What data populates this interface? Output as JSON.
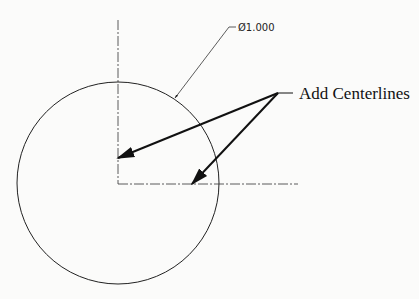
{
  "diagram": {
    "type": "engineering-drawing",
    "background": "#fbfbfa",
    "line_color": "#222222",
    "circle": {
      "cx": 118,
      "cy": 183,
      "r": 101
    },
    "centerlines": {
      "vertical": {
        "x": 118,
        "y1": 20,
        "y2": 184
      },
      "horizontal": {
        "y": 184,
        "x1": 118,
        "x2": 298
      }
    },
    "dimension": {
      "label": "Ø1.000",
      "symbol": "diameter",
      "value": "1.000",
      "text_x": 238,
      "text_y": 31,
      "leader": {
        "shoulder": [
          [
            229,
            27
          ],
          [
            236,
            27
          ]
        ],
        "to": [
          175,
          98
        ]
      }
    },
    "callout": {
      "label": "Add Centerlines",
      "text_x": 299,
      "text_y": 98,
      "shoulder": [
        [
          278,
          93
        ],
        [
          293,
          93
        ]
      ],
      "arrows": [
        {
          "from": [
            278,
            93
          ],
          "to": [
            118,
            158
          ]
        },
        {
          "from": [
            278,
            93
          ],
          "to": [
            192,
            184
          ]
        }
      ]
    }
  }
}
